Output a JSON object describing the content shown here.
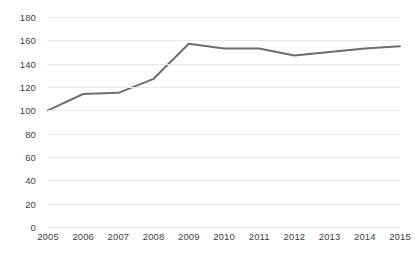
{
  "chart_data": {
    "type": "line",
    "title": "",
    "subtitle": "",
    "xlabel": "",
    "ylabel": "",
    "categories": [
      "2005",
      "2006",
      "2007",
      "2008",
      "2009",
      "2010",
      "2011",
      "2012",
      "2013",
      "2014",
      "2015"
    ],
    "x": [
      2005,
      2006,
      2007,
      2008,
      2009,
      2010,
      2011,
      2012,
      2013,
      2014,
      2015
    ],
    "series": [
      {
        "name": "Index",
        "values": [
          100,
          114,
          115,
          127,
          157,
          153,
          153,
          147,
          150,
          153,
          155
        ],
        "color": "#6e6e6e"
      }
    ],
    "values": [
      100,
      114,
      115,
      127,
      157,
      153,
      153,
      147,
      150,
      153,
      155
    ],
    "ylim": [
      0,
      180
    ],
    "ytick_step": 20,
    "yticks": [
      180,
      160,
      140,
      120,
      100,
      80,
      60,
      40,
      20,
      0
    ],
    "ytick_labels": [
      "180",
      "160",
      "140",
      "120",
      "100",
      "80",
      "60",
      "40",
      "20",
      "0"
    ],
    "xlim": [
      2005,
      2015
    ],
    "grid": {
      "horizontal": true,
      "vertical": false,
      "color": "#e9e9e9"
    },
    "legend": {
      "visible": false,
      "position": "none",
      "entries": []
    },
    "annotations": [],
    "markers": false,
    "line_width": 2,
    "background_color": "#ffffff",
    "axis_label_color": "#3f3f3f"
  }
}
